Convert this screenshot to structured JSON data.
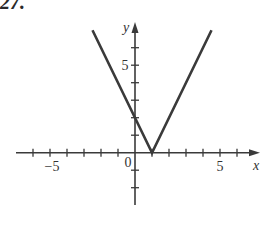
{
  "problem": {
    "number": "27."
  },
  "chart_data": {
    "type": "line",
    "title": "",
    "function": "y = 2|x - 1|",
    "xlabel": "x",
    "ylabel": "y",
    "xlim": [
      -7,
      7
    ],
    "ylim": [
      -3,
      7
    ],
    "x_tick_labels": [
      "-5",
      "0",
      "5"
    ],
    "y_tick_labels": [
      "5"
    ],
    "x_ticks": [
      -6,
      -5,
      -4,
      -3,
      -2,
      -1,
      1,
      2,
      3,
      4,
      5,
      6
    ],
    "y_ticks": [
      -2,
      -1,
      1,
      2,
      3,
      4,
      5,
      6
    ],
    "grid": false,
    "series": [
      {
        "name": "f(x)",
        "x": [
          -2.5,
          1,
          4.5
        ],
        "y": [
          7,
          0,
          7
        ]
      }
    ],
    "annotations": {
      "vertex": [
        1,
        0
      ],
      "y_intercept": [
        0,
        2
      ]
    },
    "color": "#3a3a3a"
  }
}
